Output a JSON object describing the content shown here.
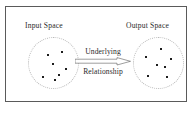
{
  "figure": {
    "background_color": "#ffffff",
    "border_color": "#5a5a5a",
    "dot_color": "#1d1d1d",
    "ellipse_outline_color": "#b9b9b9",
    "text_color": "#2a2a2a"
  },
  "input_space": {
    "label": "Input Space",
    "points": [
      {
        "x": 18,
        "y": 16
      },
      {
        "x": 32,
        "y": 13
      },
      {
        "x": 23,
        "y": 25
      },
      {
        "x": 36,
        "y": 30
      },
      {
        "x": 13,
        "y": 38
      },
      {
        "x": 25,
        "y": 41
      },
      {
        "x": 29,
        "y": 36
      }
    ]
  },
  "output_space": {
    "label": "Output Space",
    "points": [
      {
        "x": 26,
        "y": 10
      },
      {
        "x": 11,
        "y": 18
      },
      {
        "x": 36,
        "y": 20
      },
      {
        "x": 22,
        "y": 26
      },
      {
        "x": 30,
        "y": 28
      },
      {
        "x": 13,
        "y": 37
      },
      {
        "x": 32,
        "y": 38
      }
    ]
  },
  "relationship": {
    "line_one": "Underlying",
    "line_two": "Relationship",
    "arrow_direction": "left-to-right",
    "arrow_icon": "long-arrow-right-icon"
  }
}
